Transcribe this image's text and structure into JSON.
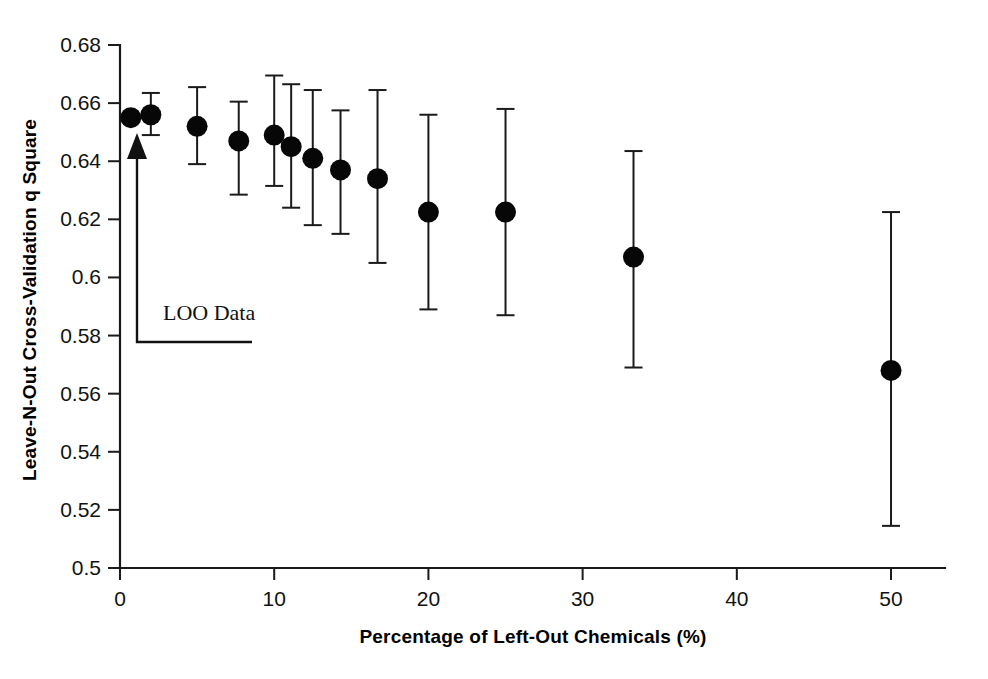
{
  "chart_data": {
    "type": "scatter",
    "title": "",
    "xlabel": "Percentage of Left-Out Chemicals (%)",
    "ylabel": "Leave-N-Out Cross-Validation q Square",
    "xlim": [
      0,
      53.5
    ],
    "ylim": [
      0.5,
      0.68
    ],
    "grid": false,
    "legend": null,
    "xticks": [
      0,
      10,
      20,
      30,
      40,
      50
    ],
    "xtick_labels": [
      "0",
      "10",
      "20",
      "30",
      "40",
      "50"
    ],
    "yticks": [
      0.5,
      0.52,
      0.54,
      0.56,
      0.58,
      0.6,
      0.62,
      0.64,
      0.66,
      0.68
    ],
    "ytick_labels": [
      "0.5",
      "0.52",
      "0.54",
      "0.56",
      "0.58",
      "0.6",
      "0.62",
      "0.64",
      "0.66",
      "0.68"
    ],
    "error_bars": "vertical",
    "marker": "filled-circle",
    "series": [
      {
        "name": "Leave-N-Out q Square",
        "x": [
          0.7,
          2.0,
          5.0,
          7.7,
          10.0,
          11.1,
          12.5,
          14.3,
          16.7,
          20.0,
          25.0,
          33.3,
          50.0
        ],
        "y": [
          0.655,
          0.656,
          0.652,
          0.647,
          0.649,
          0.645,
          0.641,
          0.637,
          0.634,
          0.6225,
          0.6225,
          0.607,
          0.568
        ],
        "yerr_low": [
          0.655,
          0.649,
          0.639,
          0.6285,
          0.6315,
          0.624,
          0.618,
          0.615,
          0.605,
          0.589,
          0.587,
          0.569,
          0.5145
        ],
        "yerr_high": [
          0.655,
          0.6635,
          0.6655,
          0.6605,
          0.6695,
          0.6665,
          0.6645,
          0.6575,
          0.6645,
          0.656,
          0.658,
          0.6435,
          0.6225
        ]
      }
    ],
    "annotations": [
      {
        "text": "LOO Data",
        "points_to_x": 0.7,
        "points_to_y": 0.6465
      }
    ]
  }
}
